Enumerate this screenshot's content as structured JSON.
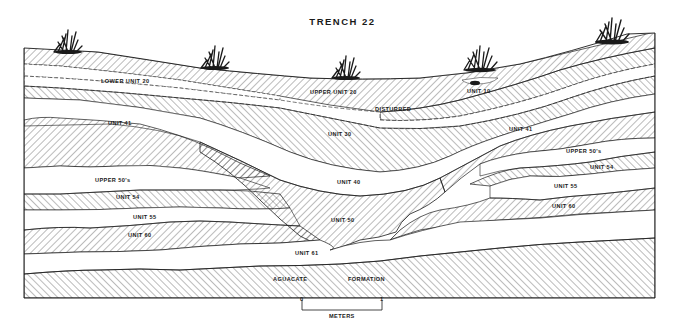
{
  "title": "TRENCH 22",
  "units": [
    {
      "id": "upper-unit-20",
      "label": "UPPER UNIT 20",
      "x": 335,
      "y": 92
    },
    {
      "id": "lower-unit-20",
      "label": "LOWER UNIT 20",
      "x": 128,
      "y": 82
    },
    {
      "id": "unit-10",
      "label": "UNIT 10",
      "x": 478,
      "y": 92
    },
    {
      "id": "disturbed",
      "label": "DISTURBED",
      "x": 383,
      "y": 110
    },
    {
      "id": "unit-41-left",
      "label": "UNIT 41",
      "x": 123,
      "y": 124
    },
    {
      "id": "unit-41-right",
      "label": "UNIT 41",
      "x": 522,
      "y": 130
    },
    {
      "id": "unit-30",
      "label": "UNIT 30",
      "x": 340,
      "y": 136
    },
    {
      "id": "upper-50s-right",
      "label": "UPPER 50's",
      "x": 565,
      "y": 153
    },
    {
      "id": "upper-50s-left",
      "label": "UPPER 50's",
      "x": 96,
      "y": 181
    },
    {
      "id": "unit-40",
      "label": "UNIT 40",
      "x": 345,
      "y": 183
    },
    {
      "id": "unit-54-right",
      "label": "UNIT 54",
      "x": 591,
      "y": 169
    },
    {
      "id": "unit-54-left",
      "label": "UNIT 54",
      "x": 129,
      "y": 198
    },
    {
      "id": "unit-55-right",
      "label": "UNIT 55",
      "x": 554,
      "y": 187
    },
    {
      "id": "unit-55-left",
      "label": "UNIT 55",
      "x": 142,
      "y": 217
    },
    {
      "id": "unit-60-right",
      "label": "UNIT 60",
      "x": 552,
      "y": 206
    },
    {
      "id": "unit-60-left",
      "label": "UNIT 60",
      "x": 139,
      "y": 236
    },
    {
      "id": "unit-50",
      "label": "UNIT 50",
      "x": 334,
      "y": 221
    },
    {
      "id": "unit-61",
      "label": "UNIT 61",
      "x": 308,
      "y": 254
    },
    {
      "id": "aguacate",
      "label": "AGUACATE",
      "x": 288,
      "y": 280
    },
    {
      "id": "formation",
      "label": "FORMATION",
      "x": 366,
      "y": 280
    }
  ],
  "scale_bar": {
    "start_label": "0",
    "end_label": "1",
    "unit_label": "METERS"
  },
  "colors": {
    "ink": "#1a1a1a",
    "paper": "#ffffff"
  }
}
